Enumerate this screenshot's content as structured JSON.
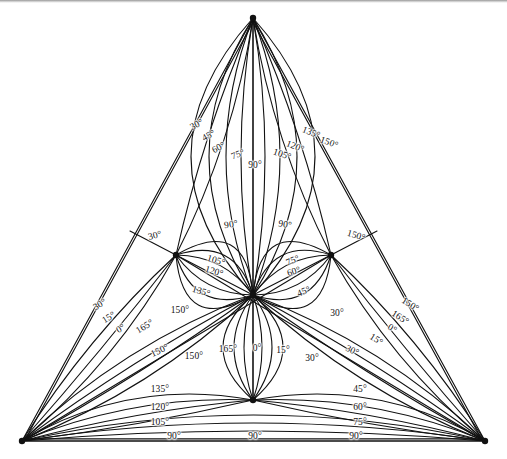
{
  "figure": {
    "background_color": "#ffffff",
    "line_color": "#111111",
    "rule_color": "#9a9a9a"
  },
  "chart_data": {
    "type": "line",
    "subtitle": "",
    "xlabel": "",
    "ylabel": "",
    "grid": false,
    "legend_position": "none",
    "xlim": [
      0,
      507
    ],
    "ylim": [
      0,
      459
    ],
    "angle_step": 15,
    "angle_values": [
      0,
      15,
      30,
      45,
      60,
      75,
      90,
      105,
      120,
      135,
      150,
      165
    ],
    "nodes": [
      {
        "name": "apex",
        "x": 253,
        "y": 18
      },
      {
        "name": "bottom-left-corner",
        "x": 22,
        "y": 441
      },
      {
        "name": "bottom-right-corner",
        "x": 485,
        "y": 441
      },
      {
        "name": "left-midpoint",
        "x": 176,
        "y": 255
      },
      {
        "name": "right-midpoint",
        "x": 331,
        "y": 255
      },
      {
        "name": "bottom-midpoint",
        "x": 253,
        "y": 400
      },
      {
        "name": "centroid",
        "x": 253,
        "y": 295
      }
    ],
    "triangle": {
      "vertices": [
        [
          253,
          18
        ],
        [
          22,
          441
        ],
        [
          485,
          441
        ]
      ],
      "double_outline": true
    },
    "labels": [
      {
        "text": "30°",
        "x": 197,
        "y": 125,
        "rot": -28
      },
      {
        "text": "45°",
        "x": 209,
        "y": 136,
        "rot": -28
      },
      {
        "text": "60°",
        "x": 219,
        "y": 148,
        "rot": -28
      },
      {
        "text": "75°",
        "x": 238,
        "y": 155,
        "rot": -20
      },
      {
        "text": "90°",
        "x": 255,
        "y": 166,
        "rot": 0
      },
      {
        "text": "105°",
        "x": 282,
        "y": 155,
        "rot": 18
      },
      {
        "text": "120°",
        "x": 295,
        "y": 147,
        "rot": 22
      },
      {
        "text": "135°",
        "x": 311,
        "y": 133,
        "rot": 22
      },
      {
        "text": "150°",
        "x": 329,
        "y": 143,
        "rot": 20
      },
      {
        "text": "30°",
        "x": 155,
        "y": 236,
        "rot": -15
      },
      {
        "text": "150°",
        "x": 356,
        "y": 236,
        "rot": 16
      },
      {
        "text": "90°",
        "x": 231,
        "y": 225,
        "rot": -8
      },
      {
        "text": "90°",
        "x": 285,
        "y": 225,
        "rot": 8
      },
      {
        "text": "105°",
        "x": 216,
        "y": 261,
        "rot": 16
      },
      {
        "text": "120°",
        "x": 214,
        "y": 272,
        "rot": 16
      },
      {
        "text": "135°",
        "x": 201,
        "y": 292,
        "rot": 16
      },
      {
        "text": "150°",
        "x": 180,
        "y": 311,
        "rot": 0
      },
      {
        "text": "75°",
        "x": 293,
        "y": 261,
        "rot": -22
      },
      {
        "text": "60°",
        "x": 294,
        "y": 272,
        "rot": -18
      },
      {
        "text": "45°",
        "x": 304,
        "y": 292,
        "rot": -22
      },
      {
        "text": "30°",
        "x": 337,
        "y": 314,
        "rot": 0
      },
      {
        "text": "30°",
        "x": 100,
        "y": 305,
        "rot": -32
      },
      {
        "text": "15°",
        "x": 109,
        "y": 318,
        "rot": -32
      },
      {
        "text": "0°",
        "x": 121,
        "y": 329,
        "rot": -32
      },
      {
        "text": "165°",
        "x": 145,
        "y": 327,
        "rot": -32
      },
      {
        "text": "150°",
        "x": 160,
        "y": 351,
        "rot": -25
      },
      {
        "text": "150°",
        "x": 410,
        "y": 305,
        "rot": 32
      },
      {
        "text": "165°",
        "x": 400,
        "y": 318,
        "rot": 32
      },
      {
        "text": "0°",
        "x": 392,
        "y": 329,
        "rot": 32
      },
      {
        "text": "15°",
        "x": 376,
        "y": 340,
        "rot": 32
      },
      {
        "text": "30°",
        "x": 352,
        "y": 351,
        "rot": 25
      },
      {
        "text": "150°",
        "x": 194,
        "y": 357,
        "rot": 0
      },
      {
        "text": "165°",
        "x": 228,
        "y": 350,
        "rot": 0
      },
      {
        "text": "0°",
        "x": 257,
        "y": 349,
        "rot": 0
      },
      {
        "text": "15°",
        "x": 283,
        "y": 351,
        "rot": 0
      },
      {
        "text": "30°",
        "x": 312,
        "y": 359,
        "rot": 0
      },
      {
        "text": "135°",
        "x": 160,
        "y": 390,
        "rot": 0
      },
      {
        "text": "120°",
        "x": 160,
        "y": 408,
        "rot": 0
      },
      {
        "text": "105°",
        "x": 160,
        "y": 423,
        "rot": 0
      },
      {
        "text": "90°",
        "x": 174,
        "y": 437,
        "rot": 0
      },
      {
        "text": "45°",
        "x": 360,
        "y": 390,
        "rot": 0
      },
      {
        "text": "60°",
        "x": 360,
        "y": 408,
        "rot": 0
      },
      {
        "text": "75°",
        "x": 360,
        "y": 423,
        "rot": 0
      },
      {
        "text": "90°",
        "x": 356,
        "y": 437,
        "rot": 0
      },
      {
        "text": "90°",
        "x": 255,
        "y": 437,
        "rot": 0
      }
    ]
  }
}
